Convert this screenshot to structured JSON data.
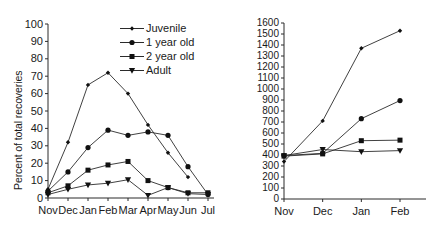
{
  "legend": {
    "position": "top-right-of-left-panel",
    "entries": [
      {
        "label": "Juvenile",
        "marker": "small-diamond"
      },
      {
        "label": "1 year old",
        "marker": "circle"
      },
      {
        "label": "2 year old",
        "marker": "square"
      },
      {
        "label": "Adult",
        "marker": "triangle-down"
      }
    ]
  },
  "colors": {
    "line": "#2b2b2b",
    "marker": "#111111",
    "axis": "#2b2b2b",
    "text": "#1a1a1a",
    "background": "#ffffff"
  },
  "chart_data": [
    {
      "id": "left-panel",
      "type": "line",
      "title": "",
      "xlabel": "",
      "ylabel": "Percent of total recoveries",
      "x": [
        "Nov",
        "Dec",
        "Jan",
        "Feb",
        "Mar",
        "Apr",
        "May",
        "Jun",
        "Jul"
      ],
      "xtick_labels": [
        "Nov",
        "Dec",
        "Jan",
        "Feb",
        "Mar",
        "Apr",
        "May",
        "Jun",
        "Jul"
      ],
      "ylim": [
        0,
        100
      ],
      "yticks": [
        0,
        10,
        20,
        30,
        40,
        50,
        60,
        70,
        80,
        90,
        100
      ],
      "ytick_labels": [
        "0",
        "10",
        "20",
        "30",
        "40",
        "50",
        "60",
        "70",
        "80",
        "90",
        "100"
      ],
      "grid": false,
      "legend_position": "upper right",
      "series": [
        {
          "name": "Juvenile",
          "marker": "small-diamond",
          "values": [
            5,
            32,
            65,
            72,
            60,
            42,
            26,
            12,
            null
          ]
        },
        {
          "name": "1 year old",
          "marker": "circle",
          "values": [
            4,
            15,
            29,
            39,
            36,
            38,
            36,
            18,
            2
          ]
        },
        {
          "name": "2 year old",
          "marker": "square",
          "values": [
            3,
            7,
            16,
            19,
            21,
            10,
            6,
            3,
            3
          ]
        },
        {
          "name": "Adult",
          "marker": "triangle-down",
          "values": [
            2,
            5,
            7.5,
            8.5,
            10.5,
            1.5,
            6,
            2.5,
            2
          ]
        }
      ]
    },
    {
      "id": "right-panel",
      "type": "line",
      "title": "",
      "xlabel": "",
      "ylabel": "",
      "x": [
        "Nov",
        "Dec",
        "Jan",
        "Feb"
      ],
      "xtick_labels": [
        "Nov",
        "Dec",
        "Jan",
        "Feb"
      ],
      "ylim": [
        0,
        1600
      ],
      "yticks": [
        0,
        100,
        200,
        300,
        400,
        500,
        600,
        700,
        800,
        900,
        1000,
        1100,
        1200,
        1300,
        1400,
        1500,
        1600
      ],
      "ytick_labels": [
        "0",
        "100",
        "200",
        "300",
        "400",
        "500",
        "600",
        "700",
        "800",
        "900",
        "1000",
        "1100",
        "1200",
        "1300",
        "1400",
        "1500",
        "1600"
      ],
      "grid": false,
      "note": "plot is cropped at the right edge; series continue beyond Feb",
      "series": [
        {
          "name": "Juvenile",
          "marker": "small-diamond",
          "values": [
            340,
            710,
            1370,
            1530
          ]
        },
        {
          "name": "1 year old",
          "marker": "circle",
          "values": [
            395,
            415,
            730,
            895
          ]
        },
        {
          "name": "2 year old",
          "marker": "square",
          "values": [
            390,
            410,
            530,
            535
          ]
        },
        {
          "name": "Adult",
          "marker": "triangle-down",
          "values": [
            395,
            450,
            430,
            440
          ]
        }
      ]
    }
  ]
}
